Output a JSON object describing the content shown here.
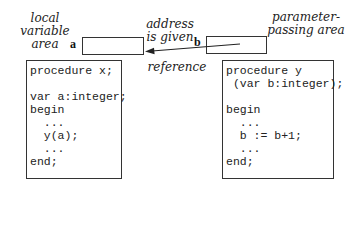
{
  "labels": {
    "local_area": [
      "local variable",
      "area"
    ],
    "param_area": [
      "parameter-",
      "passing area"
    ],
    "address": [
      "address",
      "is given"
    ],
    "reference": "reference",
    "var_a": "a",
    "var_b": "b"
  },
  "left_code": {
    "lines": [
      "procedure x;",
      "",
      "var a:integer;",
      "begin",
      "  ...",
      "  y(a);",
      "  ...",
      "end;"
    ]
  },
  "right_code": {
    "lines": [
      "procedure y",
      " (var b:integer);",
      "",
      "begin",
      "  ...",
      "  b := b+1;",
      "  ...",
      "end;"
    ]
  }
}
